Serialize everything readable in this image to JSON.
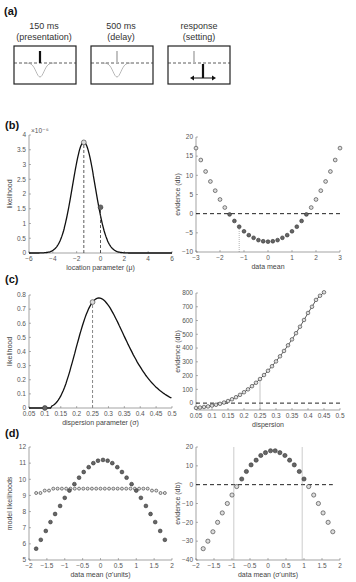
{
  "panels": {
    "a": {
      "label": "(a)",
      "stimuli": [
        {
          "line1": "150 ms",
          "line2": "(presentation)"
        },
        {
          "line1": "500 ms",
          "line2": "(delay)"
        },
        {
          "line1": "response",
          "line2": "(setting)"
        }
      ]
    },
    "b": {
      "label": "(b)"
    },
    "c": {
      "label": "(c)"
    },
    "d": {
      "label": "(d)"
    }
  },
  "chart_data": [
    {
      "panel": "b-left",
      "type": "line",
      "xlabel": "location parameter (μ)",
      "ylabel": "likelihood",
      "yexponent": "×10⁻⁶",
      "xlim": [
        -6,
        6
      ],
      "ylim": [
        0,
        4
      ],
      "xticks": [
        -6,
        -4,
        -2,
        0,
        2,
        4,
        6
      ],
      "yticks": [
        0,
        0.5,
        1,
        1.5,
        2,
        2.5,
        3,
        3.5,
        4
      ],
      "curve": {
        "shape": "gaussian",
        "mean": -1.4,
        "sd": 0.95,
        "peak": 3.75
      },
      "markers": [
        {
          "x": -1.4,
          "y": 3.75,
          "style": "open"
        },
        {
          "x": 0,
          "y": 1.55,
          "style": "filled"
        }
      ],
      "vlines": [
        -1.4,
        0
      ]
    },
    {
      "panel": "b-right",
      "type": "scatter",
      "xlabel": "data mean",
      "ylabel": "evidence (db)",
      "xlim": [
        -3,
        3
      ],
      "ylim": [
        -10,
        20
      ],
      "xticks": [
        -3,
        -2,
        -1,
        0,
        1,
        2,
        3
      ],
      "yticks": [
        -10,
        -5,
        0,
        5,
        10,
        15,
        20
      ],
      "x": [
        -3,
        -2.8,
        -2.6,
        -2.4,
        -2.2,
        -2.0,
        -1.8,
        -1.6,
        -1.4,
        -1.2,
        -1.0,
        -0.8,
        -0.6,
        -0.4,
        -0.2,
        0,
        0.2,
        0.4,
        0.6,
        0.8,
        1.0,
        1.2,
        1.4,
        1.6,
        1.8,
        2.0,
        2.2,
        2.4,
        2.6,
        2.8,
        3.0
      ],
      "y": [
        17.1,
        14.0,
        11.0,
        8.4,
        6.0,
        3.7,
        1.6,
        -0.2,
        -1.9,
        -3.4,
        -4.6,
        -5.6,
        -6.3,
        -6.9,
        -7.2,
        -7.3,
        -7.2,
        -6.9,
        -6.3,
        -5.6,
        -4.6,
        -3.4,
        -1.9,
        -0.2,
        1.6,
        3.7,
        6.0,
        8.4,
        11.0,
        14.0,
        17.1
      ],
      "hline": 0,
      "vline": -1.2
    },
    {
      "panel": "c-left",
      "type": "line",
      "xlabel": "dispersion parameter (σ)",
      "ylabel": "likelihood",
      "xlim": [
        0.05,
        0.5
      ],
      "ylim": [
        0,
        0.8
      ],
      "xticks": [
        0.05,
        0.1,
        0.15,
        0.2,
        0.25,
        0.3,
        0.35,
        0.4,
        0.45,
        0.5
      ],
      "yticks": [
        0,
        0.1,
        0.2,
        0.3,
        0.4,
        0.5,
        0.6,
        0.7,
        0.8
      ],
      "curve": {
        "shape": "skewed",
        "peak_x": 0.25,
        "peak": 0.75
      },
      "markers": [
        {
          "x": 0.25,
          "y": 0.75,
          "style": "open"
        },
        {
          "x": 0.1,
          "y": 0.0,
          "style": "filled"
        }
      ],
      "vlines": [
        0.25
      ]
    },
    {
      "panel": "c-right",
      "type": "line",
      "xlabel": "dispersion",
      "ylabel": "evidence (db)",
      "xlim": [
        0.05,
        0.5
      ],
      "ylim": [
        -50,
        800
      ],
      "xticks": [
        0.05,
        0.1,
        0.15,
        0.2,
        0.25,
        0.3,
        0.35,
        0.4,
        0.45,
        0.5
      ],
      "yticks": [
        0,
        100,
        200,
        300,
        400,
        500,
        600,
        700,
        800
      ],
      "x": [
        0.05,
        0.0625,
        0.075,
        0.0875,
        0.1,
        0.1125,
        0.125,
        0.1375,
        0.15,
        0.1625,
        0.175,
        0.1875,
        0.2,
        0.2125,
        0.225,
        0.2375,
        0.25,
        0.2625,
        0.275,
        0.2875,
        0.3,
        0.3125,
        0.325,
        0.3375,
        0.35,
        0.3625,
        0.375,
        0.3875,
        0.4,
        0.4125,
        0.425,
        0.4375,
        0.45
      ],
      "y": [
        -35,
        -32,
        -28,
        -24,
        -18,
        -12,
        -5,
        4,
        15,
        28,
        43,
        60,
        79,
        100,
        123,
        148,
        175,
        204,
        235,
        268,
        303,
        340,
        379,
        420,
        463,
        508,
        555,
        604,
        655,
        700,
        750,
        780,
        805
      ],
      "hline": 0,
      "vline": 0.25
    },
    {
      "panel": "d-left",
      "type": "scatter",
      "xlabel": "data mean (σ'units)",
      "ylabel": "model likelihoods",
      "xlim": [
        -2,
        2
      ],
      "ylim": [
        5,
        12
      ],
      "xticks": [
        -2,
        -1.5,
        -1,
        -0.5,
        0,
        0.5,
        1,
        1.5,
        2
      ],
      "yticks": [
        5,
        6,
        7,
        8,
        9,
        10,
        11,
        12
      ],
      "series": [
        {
          "name": "filled",
          "x": [
            -1.8,
            -1.67,
            -1.53,
            -1.4,
            -1.27,
            -1.13,
            -1.0,
            -0.87,
            -0.73,
            -0.6,
            -0.47,
            -0.33,
            -0.2,
            -0.07,
            0.07,
            0.2,
            0.33,
            0.47,
            0.6,
            0.73,
            0.87,
            1.0,
            1.13,
            1.27,
            1.4,
            1.53,
            1.67,
            1.8
          ],
          "y": [
            5.7,
            6.25,
            6.8,
            7.35,
            7.85,
            8.35,
            8.85,
            9.3,
            9.7,
            10.1,
            10.45,
            10.75,
            11.0,
            11.15,
            11.2,
            11.15,
            11.0,
            10.75,
            10.45,
            10.1,
            9.7,
            9.3,
            8.85,
            8.35,
            7.85,
            7.35,
            6.8,
            6.25
          ]
        },
        {
          "name": "open",
          "y_const_approx": 9.4,
          "endpoints": 9.1
        }
      ]
    },
    {
      "panel": "d-right",
      "type": "scatter",
      "xlabel": "data mean (σ'units)",
      "ylabel": "evidence (db)",
      "xlim": [
        -2,
        2
      ],
      "ylim": [
        -40,
        20
      ],
      "xticks": [
        -2,
        -1.5,
        -1,
        -0.5,
        0,
        0.5,
        1,
        1.5,
        2
      ],
      "yticks": [
        -40,
        -30,
        -20,
        -10,
        0,
        10,
        20
      ],
      "x": [
        -1.8,
        -1.67,
        -1.53,
        -1.4,
        -1.27,
        -1.13,
        -1.0,
        -0.87,
        -0.73,
        -0.6,
        -0.47,
        -0.33,
        -0.2,
        -0.07,
        0.07,
        0.2,
        0.33,
        0.47,
        0.6,
        0.73,
        0.87,
        1.0,
        1.13,
        1.27,
        1.4,
        1.53,
        1.67,
        1.8
      ],
      "y": [
        -34,
        -30,
        -25,
        -20,
        -15,
        -10,
        -5.5,
        -1,
        3,
        7,
        10.5,
        13,
        15.5,
        17,
        18,
        18,
        17,
        15.5,
        13,
        10.5,
        7,
        3,
        -1,
        -5.5,
        -10,
        -15,
        -20,
        -25
      ],
      "hline": 0,
      "vlines": [
        -0.95,
        0.95
      ]
    }
  ]
}
